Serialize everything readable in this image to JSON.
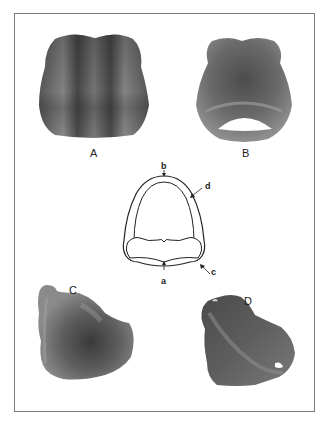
{
  "figure": {
    "panels": [
      {
        "id": "A",
        "label": "A",
        "description": "Specimen view A (dorsal/top view)"
      },
      {
        "id": "B",
        "label": "B",
        "description": "Specimen view B (with foramen opening)"
      },
      {
        "id": "C",
        "label": "C",
        "description": "Specimen view C (lateral view)"
      },
      {
        "id": "D",
        "label": "D",
        "description": "Specimen view D (oblique view)"
      }
    ],
    "schematic": {
      "labels": {
        "a": "a",
        "b": "b",
        "c": "c",
        "d": "d"
      }
    },
    "colors": {
      "frame": "#7a7a7a",
      "specimen_dark": "#3c3c3c",
      "specimen_mid": "#6e6e6e",
      "specimen_light": "#a8a8a8",
      "background": "#ffffff",
      "line": "#222222"
    }
  }
}
